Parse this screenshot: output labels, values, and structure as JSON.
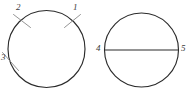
{
  "figure": {
    "background_color": "#ffffff",
    "stroke_color": "#2b2b2b",
    "tick_color": "#8e8e8e",
    "label_color": "#3a3a3a"
  },
  "left_figure": {
    "name": "circle with three tangent tick marks",
    "shape": "circle",
    "center_x": 46.5,
    "center_y": 49,
    "radius": 38.5,
    "labels": [
      {
        "id": "label-1",
        "text": "1",
        "x": 73,
        "y": 3,
        "tick_angle_deg": 40
      },
      {
        "id": "label-2",
        "text": "2",
        "x": 16,
        "y": 3,
        "tick_angle_deg": 133
      },
      {
        "id": "label-3",
        "text": "3",
        "x": 1,
        "y": 53,
        "tick_angle_deg": 196
      }
    ]
  },
  "right_figure": {
    "name": "circle with horizontal diameter chord",
    "shape": "circle",
    "center_x": 141.5,
    "center_y": 50,
    "radius": 37,
    "chord": {
      "name": "horizontal-diameter",
      "x1": 104.5,
      "y1": 50,
      "x2": 178.5,
      "y2": 50
    },
    "labels": [
      {
        "id": "label-4",
        "text": "4",
        "x": 96,
        "y": 44
      },
      {
        "id": "label-5",
        "text": "5",
        "x": 181,
        "y": 44
      }
    ]
  }
}
